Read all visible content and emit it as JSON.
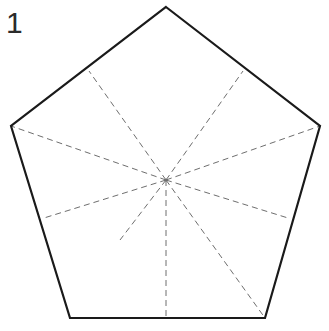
{
  "figure": {
    "step_label": "1",
    "canvas": {
      "width": 329,
      "height": 331,
      "background": "#ffffff"
    },
    "colors": {
      "outline": "#1a1a1a",
      "fold_line": "#6e6e6e",
      "label_text": "#2b2b2b",
      "background": "#ffffff"
    },
    "strokes": {
      "outline_width": 2.2,
      "fold_width": 1.0,
      "fold_dash": "6 4"
    },
    "shape": {
      "name": "pentagon",
      "sides": 5,
      "vertices": [
        {
          "name": "top",
          "x": 166,
          "y": 7
        },
        {
          "name": "right",
          "x": 320,
          "y": 126
        },
        {
          "name": "bottom-right",
          "x": 265,
          "y": 318
        },
        {
          "name": "bottom-left",
          "x": 70,
          "y": 318
        },
        {
          "name": "left",
          "x": 11,
          "y": 126
        }
      ],
      "outline_path": "M166,7 L320,126 L265,318 L70,318 L11,126 Z"
    },
    "center": {
      "name": "center",
      "x": 166,
      "y": 180
    },
    "fold_lines": [
      {
        "name": "fold-to-upper-left-edge",
        "x1": 166,
        "y1": 180,
        "x2": 89,
        "y2": 71
      },
      {
        "name": "fold-to-upper-right-edge",
        "x1": 166,
        "y1": 180,
        "x2": 243,
        "y2": 71
      },
      {
        "name": "fold-to-left-vertex",
        "x1": 166,
        "y1": 180,
        "x2": 11,
        "y2": 126
      },
      {
        "name": "fold-to-right-vertex",
        "x1": 166,
        "y1": 180,
        "x2": 320,
        "y2": 126
      },
      {
        "name": "fold-to-lower-left-edge",
        "x1": 166,
        "y1": 180,
        "x2": 44,
        "y2": 218
      },
      {
        "name": "fold-to-lower-right-edge",
        "x1": 166,
        "y1": 180,
        "x2": 288,
        "y2": 218
      },
      {
        "name": "fold-to-bottom-edge-midpoint",
        "x1": 166,
        "y1": 180,
        "x2": 166,
        "y2": 318
      },
      {
        "name": "fold-to-bottom-right-vertex",
        "x1": 166,
        "y1": 180,
        "x2": 265,
        "y2": 318
      },
      {
        "name": "fold-lower-left-short",
        "x1": 166,
        "y1": 180,
        "x2": 120,
        "y2": 240
      }
    ]
  }
}
